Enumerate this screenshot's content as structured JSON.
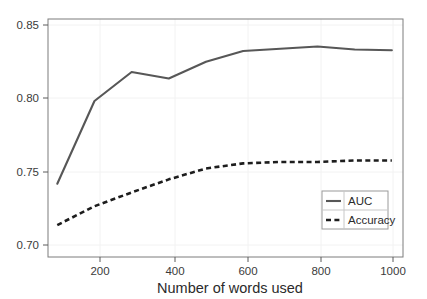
{
  "chart_data": {
    "type": "line",
    "title": "",
    "subtitle": "",
    "xlabel": "Number of words used",
    "ylabel": "",
    "x": [
      100,
      200,
      300,
      400,
      500,
      600,
      700,
      800,
      900,
      1000
    ],
    "series": [
      {
        "name": "AUC",
        "style": "solid",
        "color": "#575757",
        "values": [
          0.743,
          0.8,
          0.82,
          0.8155,
          0.827,
          0.8345,
          0.836,
          0.8375,
          0.8355,
          0.835
        ]
      },
      {
        "name": "Accuracy",
        "style": "dashed",
        "color": "#1d1d1d",
        "values": [
          0.7145,
          0.7275,
          0.737,
          0.746,
          0.7535,
          0.757,
          0.758,
          0.758,
          0.759,
          0.759
        ]
      }
    ],
    "xlim": [
      75,
      1030
    ],
    "ylim": [
      0.6925,
      0.8565
    ],
    "xticks": [
      200,
      400,
      600,
      800,
      1000
    ],
    "xticklabels": [
      "200",
      "400",
      "600",
      "800",
      "1000"
    ],
    "yticks": [
      0.7,
      0.75,
      0.8,
      0.85
    ],
    "yticklabels": [
      "0.70",
      "0.75",
      "0.80",
      "0.85"
    ],
    "grid": true,
    "legend": {
      "position": "bottom-right",
      "entries": [
        "AUC",
        "Accuracy"
      ]
    }
  },
  "axis": {
    "y_tick_0": "0.85",
    "y_tick_1": "0.80",
    "y_tick_2": "0.75",
    "y_tick_3": "0.70",
    "x_tick_0": "200",
    "x_tick_1": "400",
    "x_tick_2": "600",
    "x_tick_3": "800",
    "x_tick_4": "1000",
    "x_title": "Number of words used"
  },
  "legend": {
    "entry_auc": "AUC",
    "entry_accuracy": "Accuracy"
  }
}
